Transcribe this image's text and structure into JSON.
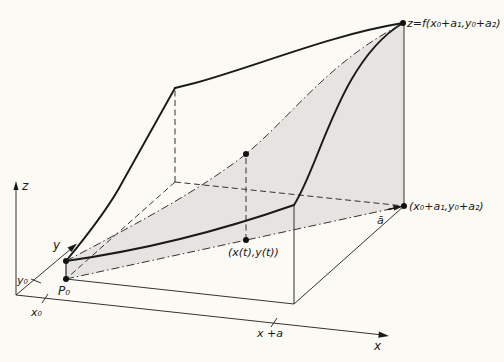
{
  "figure": {
    "type": "3d-surface-diagram",
    "colors": {
      "background": "#fbfaf5",
      "shading": "#e6e4e0",
      "ink": "#1a1a1a"
    },
    "axes": {
      "x_label": "x",
      "y_label": "y",
      "z_label": "z",
      "x_tick_x0": "x₀",
      "y_tick_y0": "y₀",
      "x_tick_xa": "x +a"
    },
    "labels": {
      "p0": "P₀",
      "top_value": "z=f(x₀+a₁,y₀+a₂)",
      "end_point": "(x₀+a₁,y₀+a₂)",
      "param_point": "(x(t),y(t))",
      "direction_vector": "ā"
    }
  }
}
